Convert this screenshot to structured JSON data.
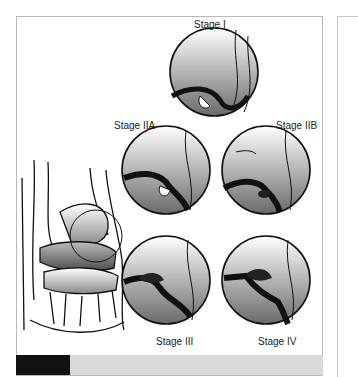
{
  "figure": {
    "stages": [
      {
        "id": "stage-1",
        "label": "Stage I"
      },
      {
        "id": "stage-2a",
        "label": "Stage IIA"
      },
      {
        "id": "stage-2b",
        "label": "Stage IIB"
      },
      {
        "id": "stage-3",
        "label": "Stage III"
      },
      {
        "id": "stage-4",
        "label": "Stage IV"
      }
    ],
    "caption": {
      "figure_label": "",
      "text": ""
    }
  }
}
